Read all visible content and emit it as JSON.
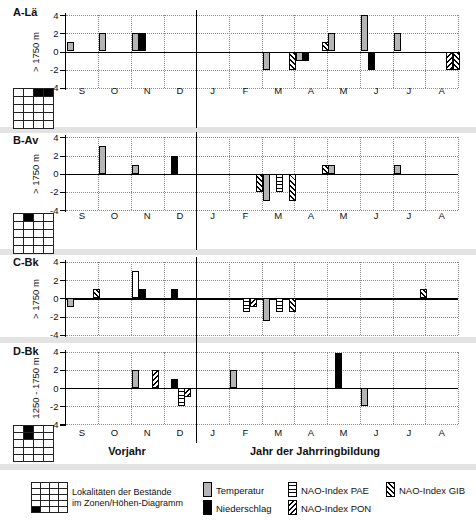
{
  "axis": {
    "ymax": 4,
    "ymin": -4,
    "ticks": [
      4,
      2,
      0,
      -2,
      -4
    ]
  },
  "months": [
    "S",
    "O",
    "N",
    "D",
    "J",
    "F",
    "M",
    "A",
    "M",
    "J",
    "J",
    "A"
  ],
  "footer": {
    "left": "Vorjahr",
    "right": "Jahr der Jahrringbildung"
  },
  "colors": {
    "temperature": "#b5b5b5",
    "precipitation": "#000000",
    "separator_band": "#e3e3e3",
    "grid_dots": "#8a8a8a"
  },
  "chart_data": [
    {
      "type": "bar",
      "panel": "A-Lä",
      "elevation": "> 1750 m",
      "x": [
        "S",
        "O",
        "N",
        "D",
        "J",
        "F",
        "M",
        "A",
        "M",
        "J",
        "J",
        "A"
      ],
      "ylim": [
        -4,
        4
      ],
      "series_legend": [
        "Temperatur",
        "Niederschlag",
        "NAO-Index PAE",
        "NAO-Index PON",
        "NAO-Index GIB"
      ],
      "bars": [
        {
          "month": "S",
          "type": "temp",
          "value": 1
        },
        {
          "month": "O",
          "type": "temp",
          "value": 2
        },
        {
          "month": "N",
          "type": "temp",
          "value": 2
        },
        {
          "month": "N",
          "type": "precip",
          "value": 2
        },
        {
          "month": "M(är)",
          "type": "temp",
          "value": -2
        },
        {
          "month": "M(är)",
          "type": "gib",
          "value": -2
        },
        {
          "month": "A(pr)",
          "type": "temp",
          "value": -1
        },
        {
          "month": "A(pr)",
          "type": "precip",
          "value": -1
        },
        {
          "month": "A(pr)",
          "type": "gib",
          "value": 1
        },
        {
          "month": "M(ai)",
          "type": "temp",
          "value": 2
        },
        {
          "month": "J(un)",
          "type": "temp",
          "value": 4
        },
        {
          "month": "J(un)",
          "type": "precip",
          "value": -2
        },
        {
          "month": "J(ul)",
          "type": "temp",
          "value": 2
        },
        {
          "month": "A(ug)",
          "type": "pon",
          "value": -2
        },
        {
          "month": "A(ug)",
          "type": "gib",
          "value": -2
        }
      ]
    },
    {
      "type": "bar",
      "panel": "B-Av",
      "elevation": "> 1750 m",
      "x": [
        "S",
        "O",
        "N",
        "D",
        "J",
        "F",
        "M",
        "A",
        "M",
        "J",
        "J",
        "A"
      ],
      "ylim": [
        -4,
        4
      ],
      "bars": [
        {
          "month": "O",
          "type": "temp",
          "value": 3
        },
        {
          "month": "N",
          "type": "temp",
          "value": 1
        },
        {
          "month": "D",
          "type": "precip",
          "value": 2
        },
        {
          "month": "F",
          "type": "gib",
          "value": -2
        },
        {
          "month": "M(är)",
          "type": "temp",
          "value": -3
        },
        {
          "month": "M(är)",
          "type": "pae",
          "value": -2
        },
        {
          "month": "M(är)",
          "type": "gib",
          "value": -3
        },
        {
          "month": "A(pr)",
          "type": "gib",
          "value": 1
        },
        {
          "month": "M(ai)",
          "type": "temp",
          "value": 1
        },
        {
          "month": "J(ul)",
          "type": "temp",
          "value": 1
        }
      ]
    },
    {
      "type": "bar",
      "panel": "C-Bk",
      "elevation": "> 1750 m",
      "x": [
        "S",
        "O",
        "N",
        "D",
        "J",
        "F",
        "M",
        "A",
        "M",
        "J",
        "J",
        "A"
      ],
      "ylim": [
        -4,
        4
      ],
      "bars": [
        {
          "month": "S",
          "type": "temp",
          "value": -1
        },
        {
          "month": "S",
          "type": "gib",
          "value": 1
        },
        {
          "month": "N",
          "type": "temp",
          "value": 3,
          "open": true
        },
        {
          "month": "N",
          "type": "precip",
          "value": 1
        },
        {
          "month": "D",
          "type": "precip",
          "value": 1
        },
        {
          "month": "F",
          "type": "pae",
          "value": -1.5
        },
        {
          "month": "F",
          "type": "pon",
          "value": -1
        },
        {
          "month": "M(är)",
          "type": "temp",
          "value": -2.5
        },
        {
          "month": "M(är)",
          "type": "pae",
          "value": -1.5
        },
        {
          "month": "M(är)",
          "type": "gib",
          "value": -1.5
        },
        {
          "month": "J(ul)",
          "type": "gib",
          "value": 1
        }
      ]
    },
    {
      "type": "bar",
      "panel": "D-Bk",
      "elevation": "1250 - 1750 m",
      "x": [
        "S",
        "O",
        "N",
        "D",
        "J",
        "F",
        "M",
        "A",
        "M",
        "J",
        "J",
        "A"
      ],
      "ylim": [
        -4,
        4
      ],
      "bars": [
        {
          "month": "N",
          "type": "temp",
          "value": 2
        },
        {
          "month": "N",
          "type": "pon",
          "value": 2
        },
        {
          "month": "D",
          "type": "precip",
          "value": 1
        },
        {
          "month": "D",
          "type": "pae",
          "value": -2
        },
        {
          "month": "D",
          "type": "pon",
          "value": -1
        },
        {
          "month": "F",
          "type": "temp",
          "value": 2
        },
        {
          "month": "M(ai)",
          "type": "precip",
          "value": 3.8
        },
        {
          "month": "J(un)",
          "type": "temp",
          "value": -2
        }
      ]
    }
  ],
  "panels": [
    {
      "id": "A",
      "label": "A-Lä",
      "elevation": "> 1750 m",
      "locality_grid": {
        "rows": 5,
        "cols": 4,
        "filled": [
          [
            0,
            2
          ],
          [
            0,
            3
          ]
        ]
      },
      "bars": [
        {
          "m": 0,
          "t": "temp",
          "v": 1
        },
        {
          "m": 1,
          "t": "temp",
          "v": 2
        },
        {
          "m": 2,
          "t": "temp",
          "v": 2
        },
        {
          "m": 2,
          "t": "precip",
          "v": 2
        },
        {
          "m": 6,
          "t": "temp",
          "v": -2
        },
        {
          "m": 6,
          "t": "gib",
          "v": -2
        },
        {
          "m": 7,
          "t": "temp",
          "v": -1
        },
        {
          "m": 7,
          "t": "precip",
          "v": -1
        },
        {
          "m": 7,
          "t": "gib",
          "v": 1
        },
        {
          "m": 8,
          "t": "temp",
          "v": 2
        },
        {
          "m": 9,
          "t": "temp",
          "v": 4
        },
        {
          "m": 9,
          "t": "precip",
          "v": -2
        },
        {
          "m": 10,
          "t": "temp",
          "v": 2
        },
        {
          "m": 11,
          "t": "pon",
          "v": -2
        },
        {
          "m": 11,
          "t": "gib",
          "v": -2
        }
      ]
    },
    {
      "id": "B",
      "label": "B-Av",
      "elevation": "> 1750 m",
      "locality_grid": {
        "rows": 5,
        "cols": 4,
        "filled": [
          [
            0,
            1
          ]
        ]
      },
      "bars": [
        {
          "m": 1,
          "t": "temp",
          "v": 3
        },
        {
          "m": 2,
          "t": "temp",
          "v": 1
        },
        {
          "m": 3,
          "t": "precip",
          "v": 2
        },
        {
          "m": 5,
          "t": "gib",
          "v": -2
        },
        {
          "m": 6,
          "t": "temp",
          "v": -3
        },
        {
          "m": 6,
          "t": "pae",
          "v": -2
        },
        {
          "m": 6,
          "t": "gib",
          "v": -3
        },
        {
          "m": 7,
          "t": "gib",
          "v": 1
        },
        {
          "m": 8,
          "t": "temp",
          "v": 1
        },
        {
          "m": 10,
          "t": "temp",
          "v": 1
        }
      ]
    },
    {
      "id": "C",
      "label": "C-Bk",
      "elevation": "> 1750 m",
      "locality_grid": null,
      "bars": [
        {
          "m": 0,
          "t": "temp",
          "v": -1
        },
        {
          "m": 0,
          "t": "gib",
          "v": 1
        },
        {
          "m": 2,
          "t": "temp",
          "v": 3,
          "open": true
        },
        {
          "m": 2,
          "t": "precip",
          "v": 1
        },
        {
          "m": 3,
          "t": "precip",
          "v": 1
        },
        {
          "m": 5,
          "t": "pae",
          "v": -1.5
        },
        {
          "m": 5,
          "t": "pon",
          "v": -1
        },
        {
          "m": 6,
          "t": "temp",
          "v": -2.5
        },
        {
          "m": 6,
          "t": "pae",
          "v": -1.5
        },
        {
          "m": 6,
          "t": "gib",
          "v": -1.5
        },
        {
          "m": 10,
          "t": "gib",
          "v": 1
        }
      ]
    },
    {
      "id": "D",
      "label": "D-Bk",
      "elevation": "1250 - 1750 m",
      "locality_grid": {
        "rows": 5,
        "cols": 4,
        "filled": [
          [
            0,
            1
          ],
          [
            1,
            1
          ]
        ]
      },
      "bars": [
        {
          "m": 2,
          "t": "temp",
          "v": 2
        },
        {
          "m": 2,
          "t": "pon",
          "v": 2
        },
        {
          "m": 3,
          "t": "precip",
          "v": 1
        },
        {
          "m": 3,
          "t": "pae",
          "v": -2
        },
        {
          "m": 3,
          "t": "pon",
          "v": -1
        },
        {
          "m": 5,
          "t": "temp",
          "v": 2
        },
        {
          "m": 8,
          "t": "precip",
          "v": 3.8
        },
        {
          "m": 9,
          "t": "temp",
          "v": -2
        }
      ]
    }
  ],
  "legend": {
    "grid": {
      "rows": 5,
      "cols": 4,
      "filled": [
        [
          4,
          0
        ]
      ]
    },
    "grid_label_line1": "Lokalitäten der Bestände",
    "grid_label_line2": "im Zonen/Höhen-Diagramm",
    "items": [
      {
        "label": "Temperatur",
        "swatch": "temp"
      },
      {
        "label": "Niederschlag",
        "swatch": "precip"
      },
      {
        "label": "NAO-Index PAE",
        "swatch": "pae"
      },
      {
        "label": "NAO-Index PON",
        "swatch": "pon"
      },
      {
        "label": "NAO-Index GIB",
        "swatch": "gib"
      }
    ]
  }
}
